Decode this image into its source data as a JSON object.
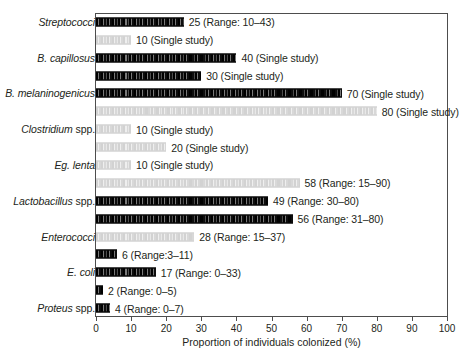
{
  "chart_data": {
    "type": "bar",
    "orientation": "horizontal",
    "title": "",
    "xlabel": "Proportion of individuals colonized (%)",
    "ylabel": "",
    "xlim": [
      0,
      100
    ],
    "xticks": [
      0,
      10,
      20,
      30,
      40,
      50,
      60,
      70,
      80,
      90,
      100
    ],
    "xtick_labels": [
      "0",
      "10",
      "20",
      "30",
      "40",
      "50",
      "60",
      "70",
      "80",
      "90",
      "100"
    ],
    "grid": false,
    "legend": null,
    "categories": [
      "Streptococci",
      "B. capillosus",
      "B. melaninogenicus",
      "Clostridium spp.",
      "Eg. lenta",
      "Lactobacillus spp.",
      "Enterococci",
      "E. coli",
      "Proteus spp."
    ],
    "bars": [
      {
        "category": "Streptococci",
        "category_shown": true,
        "value": 25,
        "shade": "dark",
        "label": "25 (Range: 10–43)"
      },
      {
        "category": "Streptococci",
        "category_shown": false,
        "value": 10,
        "shade": "light",
        "label": "10 (Single study)"
      },
      {
        "category": "B. capillosus",
        "category_shown": true,
        "value": 40,
        "shade": "dark",
        "label": "40 (Single study)"
      },
      {
        "category": "B. capillosus",
        "category_shown": false,
        "value": 30,
        "shade": "dark",
        "label": "30 (Single study)"
      },
      {
        "category": "B. melaninogenicus",
        "category_shown": true,
        "value": 70,
        "shade": "dark",
        "label": "70 (Single study)"
      },
      {
        "category": "B. melaninogenicus",
        "category_shown": false,
        "value": 80,
        "shade": "light",
        "label": "80 (Single study)"
      },
      {
        "category": "Clostridium spp.",
        "category_shown": true,
        "value": 10,
        "shade": "light",
        "label": "10 (Single study)"
      },
      {
        "category": "Clostridium spp.",
        "category_shown": false,
        "value": 20,
        "shade": "light",
        "label": "20 (Single study)"
      },
      {
        "category": "Eg. lenta",
        "category_shown": true,
        "value": 10,
        "shade": "light",
        "label": "10 (Single study)"
      },
      {
        "category": "Eg. lenta",
        "category_shown": false,
        "value": 58,
        "shade": "light",
        "label": "58 (Range: 15–90)"
      },
      {
        "category": "Lactobacillus spp.",
        "category_shown": true,
        "value": 49,
        "shade": "dark",
        "label": "49 (Range: 30–80)"
      },
      {
        "category": "Lactobacillus spp.",
        "category_shown": false,
        "value": 56,
        "shade": "dark",
        "label": "56 (Range: 31–80)"
      },
      {
        "category": "Enterococci",
        "category_shown": true,
        "value": 28,
        "shade": "light",
        "label": "28 (Range: 15–37)"
      },
      {
        "category": "Enterococci",
        "category_shown": false,
        "value": 6,
        "shade": "dark",
        "label": "6 (Range:3–11)"
      },
      {
        "category": "E. coli",
        "category_shown": true,
        "value": 17,
        "shade": "dark",
        "label": "17 (Range: 0–33)"
      },
      {
        "category": "E. coli",
        "category_shown": false,
        "value": 2,
        "shade": "dark",
        "label": "2 (Range: 0–5)"
      },
      {
        "category": "Proteus spp.",
        "category_shown": true,
        "value": 4,
        "shade": "dark",
        "label": "4 (Range: 0–7)"
      }
    ],
    "colors": {
      "dark_bar": "#1a1a1a",
      "light_bar": "#dcdcdc",
      "axis": "#4d4d4d",
      "text": "#231f20",
      "background": "#ffffff"
    }
  }
}
